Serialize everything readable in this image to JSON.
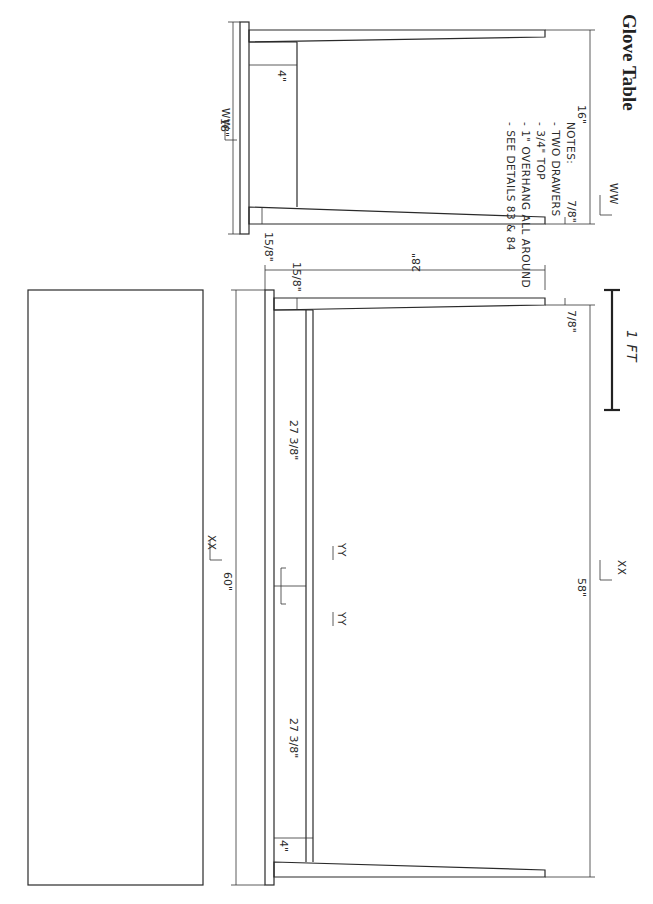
{
  "title": "Glove Table",
  "notes": {
    "heading": "NOTES:",
    "items": [
      "- TWO DRAWERS",
      "- 3/4\" TOP",
      "- 1\" OVERHANG ALL AROUND",
      "- SEE DETAILS 83 & 84"
    ]
  },
  "side_view": {
    "section_label_top": "WW",
    "section_label_bottom": "WW",
    "depth_dim": "18\"",
    "apron_dim": "4\"",
    "leg_top_dim": "15/8\"",
    "leg_foot_dim": "7/8\"",
    "inner_dim": "16\""
  },
  "front_view": {
    "section_label_top": "XX",
    "section_label_bottom": "XX",
    "detail_label_a": "YY",
    "detail_label_b": "YY",
    "width_dim": "60\"",
    "height_dim": "28\"",
    "leg_top_dim": "15/8\"",
    "leg_foot_dim": "7/8\"",
    "drawer_dim_1": "27 3/8\"",
    "drawer_dim_2": "27 3/8\"",
    "apron_dim": "4\"",
    "inner_dim": "58\""
  },
  "scale_bar": {
    "label": "1 FT"
  },
  "colors": {
    "ink": "#2a2a2a",
    "paper": "#ffffff"
  }
}
